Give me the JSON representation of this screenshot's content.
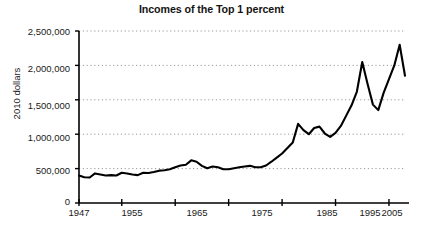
{
  "chart_data": {
    "type": "line",
    "title": "Incomes of the Top 1 percent",
    "xlabel": "",
    "ylabel": "2010 dollars",
    "xlim": [
      1947,
      2008
    ],
    "ylim": [
      0,
      2500000
    ],
    "grid": true,
    "legend": "none",
    "y_ticks": [
      0,
      500000,
      1000000,
      1500000,
      2000000,
      2500000
    ],
    "y_tick_labels": [
      "0",
      "500,000",
      "1,000,000",
      "1,500,000",
      "2,000,000",
      "2,500,000"
    ],
    "x_ticks": [
      1947,
      1955,
      1965,
      1975,
      1985,
      1995,
      2005
    ],
    "x_tick_labels": [
      "1947",
      "1955",
      "1965",
      "1975",
      "1985",
      "1995",
      "2005"
    ],
    "line_color": "#000000",
    "grid_color": "#999999",
    "axis_color": "#000000",
    "series": [
      {
        "name": "Top 1 percent income",
        "x": [
          1947,
          1948,
          1949,
          1950,
          1951,
          1952,
          1953,
          1954,
          1955,
          1956,
          1957,
          1958,
          1959,
          1960,
          1961,
          1962,
          1963,
          1964,
          1965,
          1966,
          1967,
          1968,
          1969,
          1970,
          1971,
          1972,
          1973,
          1974,
          1975,
          1976,
          1977,
          1978,
          1979,
          1980,
          1981,
          1982,
          1983,
          1984,
          1985,
          1986,
          1987,
          1988,
          1989,
          1990,
          1991,
          1992,
          1993,
          1994,
          1995,
          1996,
          1997,
          1998,
          1999,
          2000,
          2001,
          2002,
          2003,
          2004,
          2005,
          2006,
          2007,
          2008
        ],
        "values": [
          400000,
          375000,
          370000,
          430000,
          415000,
          400000,
          405000,
          400000,
          440000,
          430000,
          415000,
          405000,
          440000,
          435000,
          450000,
          470000,
          475000,
          490000,
          520000,
          545000,
          555000,
          620000,
          600000,
          540000,
          505000,
          530000,
          520000,
          490000,
          490000,
          505000,
          520000,
          530000,
          540000,
          520000,
          520000,
          545000,
          600000,
          660000,
          720000,
          800000,
          880000,
          1150000,
          1060000,
          1000000,
          1090000,
          1110000,
          1010000,
          960000,
          1020000,
          1120000,
          1270000,
          1420000,
          1620000,
          2050000,
          1730000,
          1430000,
          1350000,
          1600000,
          1800000,
          2000000,
          2300000,
          1850000
        ]
      }
    ]
  }
}
